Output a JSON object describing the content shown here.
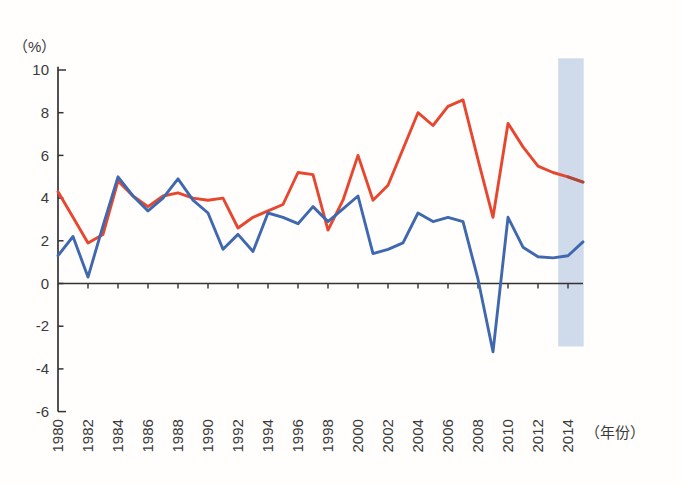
{
  "figure": {
    "percent_label": "（%）",
    "year_label": "（年份）",
    "background": "#fffefd",
    "axis_color": "#333333",
    "label_color": "#3a3a3a"
  },
  "chart_data": {
    "type": "line",
    "title": "",
    "xlabel": "（年份）",
    "ylabel": "（%）",
    "x": [
      1980,
      1981,
      1982,
      1983,
      1984,
      1985,
      1986,
      1987,
      1988,
      1989,
      1990,
      1991,
      1992,
      1993,
      1994,
      1995,
      1996,
      1997,
      1998,
      1999,
      2000,
      2001,
      2002,
      2003,
      2004,
      2005,
      2006,
      2007,
      2008,
      2009,
      2010,
      2011,
      2012,
      2013,
      2014,
      2015
    ],
    "series": [
      {
        "name": "red-line",
        "color": "#e8472f",
        "tip_color": "#9e4a40",
        "values": [
          4.3,
          3.1,
          1.9,
          2.3,
          4.8,
          4.1,
          3.6,
          4.1,
          4.25,
          4.0,
          3.9,
          4.0,
          2.6,
          3.1,
          3.4,
          3.7,
          5.2,
          5.1,
          2.5,
          3.9,
          6.0,
          3.9,
          4.6,
          6.3,
          8.0,
          7.4,
          8.3,
          8.6,
          5.8,
          3.1,
          7.5,
          6.4,
          5.5,
          5.2,
          5.0,
          4.75
        ]
      },
      {
        "name": "blue-line",
        "color": "#3f68af",
        "values": [
          1.3,
          2.2,
          0.3,
          2.7,
          5.0,
          4.1,
          3.4,
          4.0,
          4.9,
          3.9,
          3.3,
          1.6,
          2.3,
          1.5,
          3.3,
          3.1,
          2.8,
          3.6,
          2.9,
          3.5,
          4.1,
          1.4,
          1.6,
          1.9,
          3.3,
          2.9,
          3.1,
          2.9,
          0.2,
          -3.2,
          3.1,
          1.7,
          1.25,
          1.2,
          1.3,
          1.95
        ]
      }
    ],
    "y_ticks": [
      10,
      8,
      6,
      4,
      2,
      0,
      -2,
      -4,
      -6
    ],
    "x_tick_years": [
      1980,
      1982,
      1984,
      1986,
      1988,
      1990,
      1992,
      1994,
      1996,
      1998,
      2000,
      2002,
      2004,
      2006,
      2008,
      2010,
      2012,
      2014
    ],
    "ylim": [
      -6,
      10.15
    ],
    "xlim": [
      1980,
      2015
    ],
    "grid": false,
    "legend": "none",
    "highlight_band": {
      "x_start_year": 2013.35,
      "x_end_year": 2015.05,
      "y_top_value": 10.55,
      "y_bottom_value": -2.95,
      "color": "#cfdbeb"
    }
  }
}
